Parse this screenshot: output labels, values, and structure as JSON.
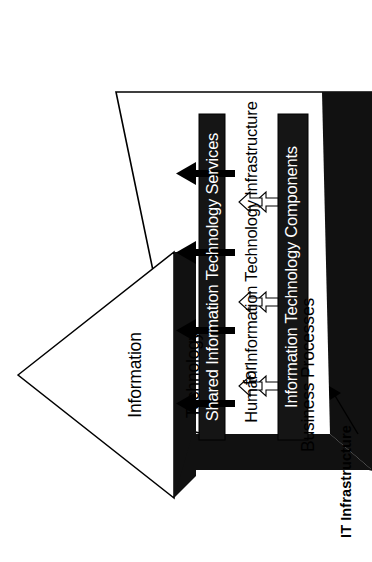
{
  "figure": {
    "type": "layered-pyramid-diagram",
    "orientation": "rotated-90-counter-clockwise",
    "background_color": "#ffffff",
    "ink_color": "#000000",
    "bar_fill_color": "#1a1a1a",
    "bar_text_color": "#ffffff"
  },
  "pyramid": {
    "title_lines": [
      "Information",
      "Technology",
      "for",
      "Business Processes"
    ],
    "title_full": "Information Technology for Business Processes"
  },
  "layers": [
    {
      "id": "shared-it-services",
      "label": "Shared Information Technology Services",
      "style": "filled-black-bar",
      "text_color": "#ffffff"
    },
    {
      "id": "human-it-infrastructure",
      "label": "Human Information Technology Infrastructure",
      "style": "plain-text-band",
      "text_color": "#000000"
    },
    {
      "id": "it-components",
      "label": "Information Technology Components",
      "style": "filled-black-bar",
      "text_color": "#ffffff"
    }
  ],
  "callout": {
    "label": "IT Infrastructure",
    "style": "bold-leader-line-with-arrow",
    "points_to": "it-infrastructure-base-slab"
  },
  "arrows": {
    "output_arrows": {
      "count": 4,
      "style": "solid-black",
      "direction": "up",
      "meaning": "IT infrastructure supports business processes"
    },
    "layer_arrows": {
      "count": 6,
      "style": "white-outlined",
      "direction": "up",
      "meaning": "lower layers feed the layer above"
    }
  }
}
